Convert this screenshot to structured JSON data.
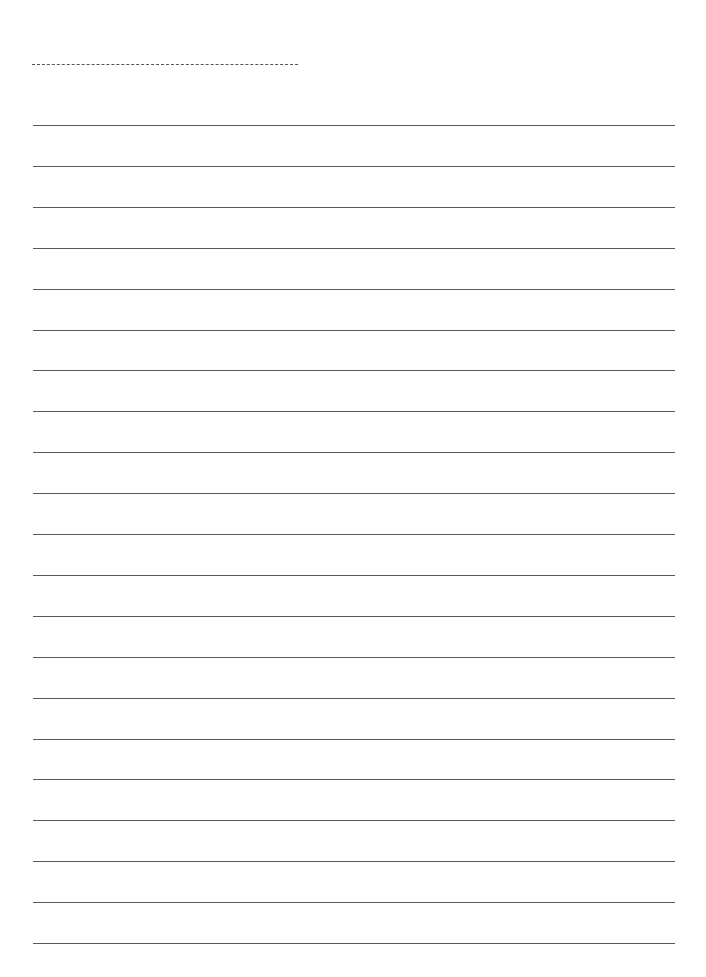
{
  "page": {
    "type": "lined-writing-paper",
    "background_color": "#ffffff",
    "line_color": "#5a5a5a"
  },
  "name_field": {
    "style": "dashed",
    "label": ""
  },
  "ruled_lines": {
    "count": 21,
    "first_top": 125,
    "spacing": 40.9
  }
}
